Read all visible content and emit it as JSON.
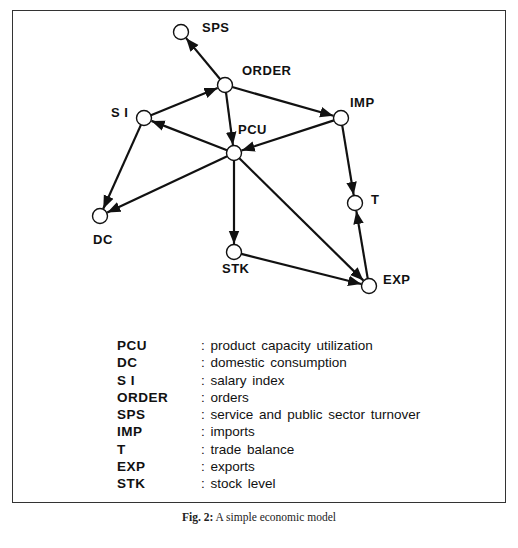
{
  "figure": {
    "caption_prefix": "Fig. 2:",
    "caption_text": " A simple economic model"
  },
  "nodes": {
    "SPS": {
      "label": "SPS",
      "x": 181,
      "y": 32
    },
    "ORDER": {
      "label": "ORDER",
      "x": 225,
      "y": 85
    },
    "SI": {
      "label": "S I",
      "x": 144,
      "y": 118
    },
    "PCU": {
      "label": "PCU",
      "x": 234,
      "y": 153
    },
    "IMP": {
      "label": "IMP",
      "x": 341,
      "y": 118
    },
    "T": {
      "label": "T",
      "x": 355,
      "y": 203
    },
    "DC": {
      "label": "DC",
      "x": 100,
      "y": 216
    },
    "STK": {
      "label": "STK",
      "x": 234,
      "y": 252
    },
    "EXP": {
      "label": "EXP",
      "x": 369,
      "y": 286
    }
  },
  "edges": [
    {
      "from": "ORDER",
      "to": "SPS"
    },
    {
      "from": "SI",
      "to": "ORDER"
    },
    {
      "from": "ORDER",
      "to": "PCU"
    },
    {
      "from": "ORDER",
      "to": "IMP"
    },
    {
      "from": "PCU",
      "to": "SI"
    },
    {
      "from": "IMP",
      "to": "PCU"
    },
    {
      "from": "SI",
      "to": "DC"
    },
    {
      "from": "PCU",
      "to": "DC"
    },
    {
      "from": "PCU",
      "to": "STK"
    },
    {
      "from": "PCU",
      "to": "EXP"
    },
    {
      "from": "IMP",
      "to": "T"
    },
    {
      "from": "EXP",
      "to": "T"
    },
    {
      "from": "STK",
      "to": "EXP"
    }
  ],
  "legend": [
    {
      "abbr": "PCU",
      "desc": ": product capacity utilization"
    },
    {
      "abbr": "DC",
      "desc": ": domestic consumption"
    },
    {
      "abbr": "S I",
      "desc": ": salary index"
    },
    {
      "abbr": "ORDER",
      "desc": ": orders"
    },
    {
      "abbr": "SPS",
      "desc": ": service and public sector turnover"
    },
    {
      "abbr": "IMP",
      "desc": ": imports"
    },
    {
      "abbr": "T",
      "desc": ": trade balance"
    },
    {
      "abbr": "EXP",
      "desc": ": exports"
    },
    {
      "abbr": "STK",
      "desc": ": stock level"
    }
  ],
  "colors": {
    "ink": "#111111",
    "frame": "#333333",
    "background": "#ffffff"
  }
}
